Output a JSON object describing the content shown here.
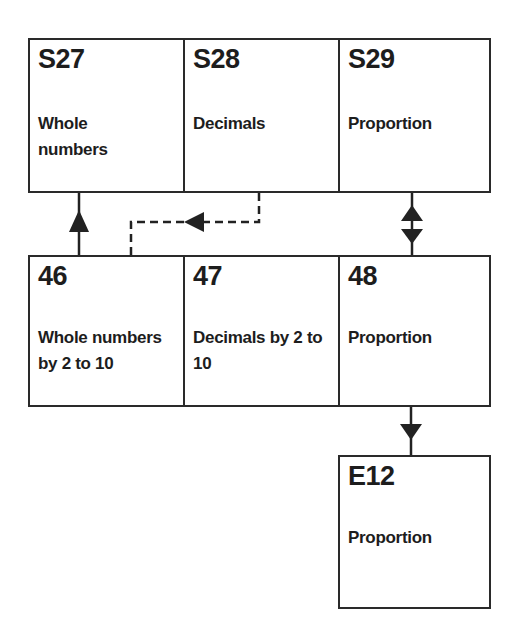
{
  "diagram": {
    "top_row": [
      {
        "code": "S27",
        "label": "Whole numbers"
      },
      {
        "code": "S28",
        "label": "Decimals"
      },
      {
        "code": "S29",
        "label": "Proportion"
      }
    ],
    "middle_row": [
      {
        "code": "46",
        "label": "Whole numbers by 2 to 10"
      },
      {
        "code": "47",
        "label": "Decimals by 2 to 10"
      },
      {
        "code": "48",
        "label": "Proportion"
      }
    ],
    "bottom": [
      {
        "code": "E12",
        "label": "Proportion"
      }
    ],
    "connections": [
      {
        "from": "46",
        "to": "S27",
        "style": "solid",
        "direction": "up"
      },
      {
        "from": "S28",
        "to": "46",
        "style": "dashed",
        "direction": "left-down"
      },
      {
        "from": "48",
        "to": "S29",
        "style": "solid",
        "direction": "both"
      },
      {
        "from": "48",
        "to": "E12",
        "style": "solid",
        "direction": "down"
      }
    ]
  }
}
